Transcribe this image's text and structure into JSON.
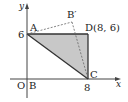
{
  "diagram": {
    "type": "coordinate-geometry",
    "axes": {
      "x_label": "x",
      "y_label": "y",
      "origin_label": "O",
      "x_tick_label": "8",
      "y_tick_label": "6"
    },
    "points": {
      "A": {
        "label": "A",
        "coords": [
          0,
          6
        ]
      },
      "B": {
        "label": "B",
        "coords": [
          0,
          0
        ]
      },
      "C": {
        "label": "C",
        "coords": [
          8,
          0
        ]
      },
      "D": {
        "label": "D(8, 6)",
        "coords": [
          8,
          6
        ]
      },
      "B_prime": {
        "label": "B′"
      }
    },
    "shaded_triangle": [
      "A",
      "D",
      "C"
    ],
    "dashed_segments": [
      [
        "A",
        "B_prime"
      ],
      [
        "B_prime",
        "C"
      ]
    ],
    "colors": {
      "fill": "#c8c8c8",
      "stroke": "#333333",
      "dashed": "#666666",
      "axis": "#444444"
    }
  }
}
